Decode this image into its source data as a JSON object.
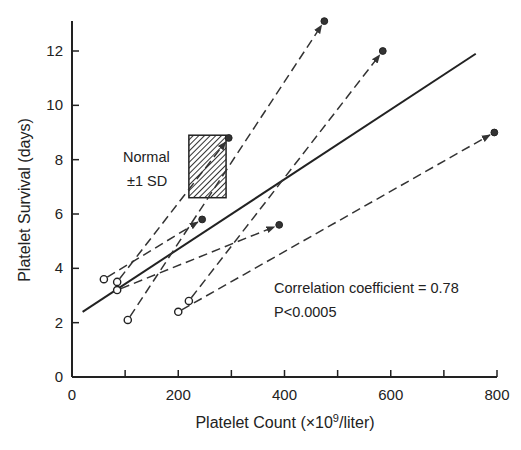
{
  "chart_data": {
    "type": "scatter",
    "title": "",
    "xlabel": "Platelet Count (×10⁹/liter)",
    "xlabel_parts": {
      "prefix": "Platelet Count (×10",
      "sup": "9",
      "suffix": "/liter)"
    },
    "ylabel": "Platelet Survival (days)",
    "xlim": [
      0,
      800
    ],
    "ylim": [
      0,
      13
    ],
    "x_ticks": [
      0,
      200,
      400,
      600,
      800
    ],
    "x_minor_ticks": [
      100,
      300,
      500,
      700
    ],
    "y_ticks": [
      0,
      2,
      4,
      6,
      8,
      10,
      12
    ],
    "grid": false,
    "legend": null,
    "series": [
      {
        "name": "Before (open circles)",
        "marker": "open-circle",
        "x": [
          60,
          85,
          85,
          105,
          220,
          200
        ],
        "y": [
          3.6,
          3.5,
          3.2,
          2.1,
          2.8,
          2.4
        ]
      },
      {
        "name": "After (filled circles)",
        "marker": "filled-circle",
        "x": [
          245,
          295,
          390,
          475,
          585,
          795
        ],
        "y": [
          5.8,
          8.8,
          5.6,
          13.1,
          12.0,
          9.0
        ]
      }
    ],
    "paired_arrows": [
      {
        "from": [
          60,
          3.6
        ],
        "to": [
          245,
          5.8
        ]
      },
      {
        "from": [
          85,
          3.5
        ],
        "to": [
          295,
          8.8
        ]
      },
      {
        "from": [
          85,
          3.2
        ],
        "to": [
          390,
          5.6
        ]
      },
      {
        "from": [
          105,
          2.1
        ],
        "to": [
          475,
          13.1
        ]
      },
      {
        "from": [
          220,
          2.8
        ],
        "to": [
          585,
          12.0
        ]
      },
      {
        "from": [
          200,
          2.4
        ],
        "to": [
          795,
          9.0
        ]
      }
    ],
    "regression_line": {
      "from": [
        20,
        2.4
      ],
      "to": [
        760,
        11.9
      ]
    },
    "normal_range_box": {
      "label_line1": "Normal",
      "label_line2": "±1 SD",
      "x": [
        220,
        290
      ],
      "y": [
        6.6,
        8.9
      ],
      "fill": "hatched"
    },
    "annotations": [
      "Correlation coefficient = 0.78",
      "P<0.0005"
    ]
  },
  "labels": {
    "normal_line1": "Normal",
    "normal_line2": "±1 SD",
    "corr": "Correlation coefficient = 0.78",
    "pval": "P<0.0005",
    "ylabel": "Platelet Survival (days)",
    "xlabel_prefix": "Platelet Count (×10",
    "xlabel_sup": "9",
    "xlabel_suffix": "/liter)",
    "xticks": [
      "0",
      "200",
      "400",
      "600",
      "800"
    ],
    "yticks": [
      "0",
      "2",
      "4",
      "6",
      "8",
      "10",
      "12"
    ]
  }
}
